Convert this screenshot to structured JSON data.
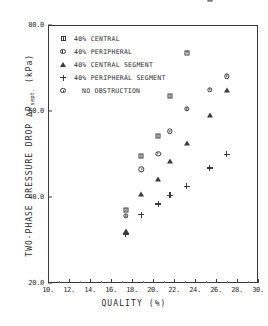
{
  "chart_data": {
    "type": "scatter",
    "title": "",
    "xlabel": "QUALITY (%)",
    "ylabel": "TWO-PHASE PRESSURE DROP ΔP",
    "ylabel_subscript": "sept.",
    "yunit": "(kPa)",
    "xlim": [
      10,
      30
    ],
    "ylim": [
      20,
      80
    ],
    "xticks": [
      "10.",
      "12.",
      "14.",
      "16.",
      "18.",
      "20.",
      "22.",
      "24.",
      "26.",
      "28.",
      "30."
    ],
    "xtick_values": [
      10,
      12,
      14,
      16,
      18,
      20,
      22,
      24,
      26,
      28,
      30
    ],
    "yticks": [
      "80.0",
      "60.0",
      "40.0",
      "20.0"
    ],
    "ytick_values": [
      80,
      60,
      40,
      20
    ],
    "grid": false,
    "legend_position": "top-left",
    "series": [
      {
        "name": "40% CENTRAL",
        "marker": "square",
        "points": [
          {
            "x": 17.4,
            "y": 37.0
          },
          {
            "x": 18.9,
            "y": 49.5
          },
          {
            "x": 20.5,
            "y": 54.2
          },
          {
            "x": 21.6,
            "y": 63.4
          },
          {
            "x": 23.2,
            "y": 73.6
          },
          {
            "x": 25.4,
            "y": 86.0
          }
        ]
      },
      {
        "name": "40% PERIPHERAL",
        "marker": "circle",
        "points": [
          {
            "x": 17.4,
            "y": 35.6
          },
          {
            "x": 18.9,
            "y": 46.4
          },
          {
            "x": 20.5,
            "y": 50.1
          },
          {
            "x": 21.6,
            "y": 55.3
          },
          {
            "x": 23.2,
            "y": 60.5
          },
          {
            "x": 25.4,
            "y": 65.0
          },
          {
            "x": 27.0,
            "y": 68.1
          }
        ]
      },
      {
        "name": "40% CENTRAL SEGMENT",
        "marker": "triangle",
        "points": [
          {
            "x": 17.4,
            "y": 32.0
          },
          {
            "x": 18.9,
            "y": 40.6
          },
          {
            "x": 20.5,
            "y": 44.3
          },
          {
            "x": 21.6,
            "y": 48.4
          },
          {
            "x": 23.2,
            "y": 52.6
          },
          {
            "x": 25.4,
            "y": 59.1
          },
          {
            "x": 27.0,
            "y": 64.8
          }
        ]
      },
      {
        "name": "40% PERIPHERAL SEGMENT",
        "marker": "plus",
        "points": [
          {
            "x": 17.4,
            "y": 31.4
          },
          {
            "x": 18.9,
            "y": 37.3
          },
          {
            "x": 20.5,
            "y": 41.2
          },
          {
            "x": 21.6,
            "y": 44.6
          },
          {
            "x": 23.2,
            "y": 48.1
          },
          {
            "x": 25.4,
            "y": 53.7
          },
          {
            "x": 27.0,
            "y": 58.3
          }
        ]
      },
      {
        "name": "NO OBSTRUCTION",
        "marker": "circle-dot",
        "points": []
      }
    ]
  },
  "legend": {
    "items": [
      {
        "label": "40% CENTRAL",
        "marker": "square-icon",
        "indent": false
      },
      {
        "label": "40% PERIPHERAL",
        "marker": "circle-icon",
        "indent": false
      },
      {
        "label": "40% CENTRAL SEGMENT",
        "marker": "triangle-icon",
        "indent": false
      },
      {
        "label": "40% PERIPHERAL SEGMENT",
        "marker": "plus-icon",
        "indent": false
      },
      {
        "label": "NO OBSTRUCTION",
        "marker": "circle-dot-icon",
        "indent": true
      }
    ]
  }
}
